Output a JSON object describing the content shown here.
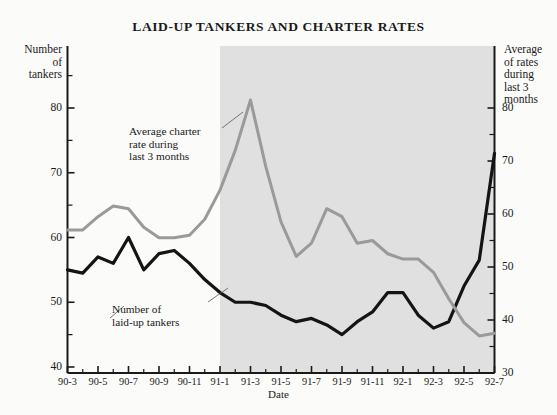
{
  "chart_data": {
    "type": "line",
    "title": "LAID-UP TANKERS AND CHARTER RATES",
    "xlabel": "Date",
    "ylabel_left": "Number of tankers",
    "ylabel_right": "Average of rates during last 3 months",
    "left_axis_caption_lines": [
      "Number",
      "of",
      "tankers"
    ],
    "right_axis_caption_lines": [
      "Average",
      "of rates",
      "during",
      "last 3",
      "months"
    ],
    "grid": false,
    "legend": "annotations",
    "ylim_left": [
      40,
      85
    ],
    "ylim_right": [
      30,
      85
    ],
    "yticks_left": [
      40,
      50,
      60,
      70,
      80
    ],
    "yticks_left_minor": [
      45,
      55,
      65,
      75,
      85
    ],
    "yticks_right": [
      30,
      40,
      50,
      60,
      70,
      80
    ],
    "yticks_right_minor": [
      35,
      45,
      55,
      65,
      75
    ],
    "categories": [
      "90-3",
      "90-4",
      "90-5",
      "90-6",
      "90-7",
      "90-8",
      "90-9",
      "90-10",
      "90-11",
      "90-12",
      "91-1",
      "91-2",
      "91-3",
      "91-4",
      "91-5",
      "91-6",
      "91-7",
      "91-8",
      "91-9",
      "91-10",
      "91-11",
      "91-12",
      "92-1",
      "92-2",
      "92-3",
      "92-4",
      "92-5",
      "92-6",
      "92-7"
    ],
    "xtick_labels": [
      "90-3",
      "90-5",
      "90-7",
      "90-9",
      "90-11",
      "91-1",
      "91-3",
      "91-5",
      "91-7",
      "91-9",
      "91-11",
      "92-1",
      "92-3",
      "92-5",
      "92-7"
    ],
    "shaded_region": {
      "from": "91-1",
      "to": "92-7",
      "color": "#e0e0e0"
    },
    "series": [
      {
        "name": "Number of laid-up tankers",
        "axis": "left",
        "color": "#141414",
        "values": [
          55,
          54.5,
          57,
          56,
          60,
          55,
          57.5,
          58,
          56,
          53.5,
          51.5,
          50,
          50,
          49.5,
          48,
          47,
          47.5,
          46.5,
          45,
          47,
          48.5,
          51.5,
          51.5,
          48,
          46,
          47,
          52.5,
          56.5,
          73
        ]
      },
      {
        "name": "Average charter rate during last 3 months",
        "axis": "right",
        "color": "#9a9a9a",
        "values": [
          57,
          57,
          59.5,
          61.5,
          61,
          57.5,
          55.5,
          55.5,
          56,
          59,
          64.5,
          72,
          81.5,
          69,
          58.5,
          52,
          54.5,
          61,
          59.5,
          54.5,
          55,
          52.5,
          51.5,
          51.5,
          49,
          44,
          39.5,
          37,
          37.5
        ]
      }
    ],
    "annotations": [
      {
        "id": "charter-rate",
        "lines": [
          "Average charter",
          "rate during",
          "last 3 months"
        ]
      },
      {
        "id": "laid-up-tankers",
        "lines": [
          "Number of",
          "laid-up tankers"
        ]
      }
    ]
  }
}
